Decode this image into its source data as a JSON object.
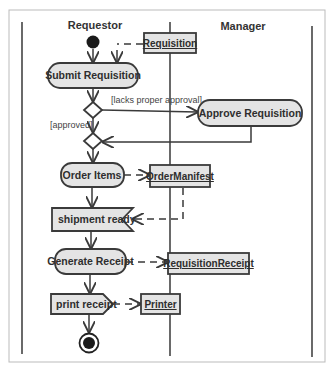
{
  "diagram": {
    "type": "UML activity diagram with swimlanes",
    "swimlanes": [
      {
        "label": "Requestor"
      },
      {
        "label": "Manager"
      }
    ],
    "actions": {
      "submit_requisition": "Submit Requisition",
      "approve_requisition": "Approve Requisition",
      "order_items": "Order Items",
      "generate_receipt": "Generate Receipt"
    },
    "signals": {
      "shipment_ready": "shipment ready",
      "print_receipt": "print receipt"
    },
    "objects": {
      "requisition": "Requisition",
      "order_manifest": "OrderManifest",
      "requisition_receipt": "RequisitionReceipt",
      "printer": "Printer"
    },
    "guards": {
      "lacks_approval": "[lacks proper approval]",
      "approved": "[approved]"
    },
    "colors": {
      "node_fill": "#e4e4e4",
      "stroke": "#3a3a3a",
      "frame": "#bbbbbb"
    }
  }
}
